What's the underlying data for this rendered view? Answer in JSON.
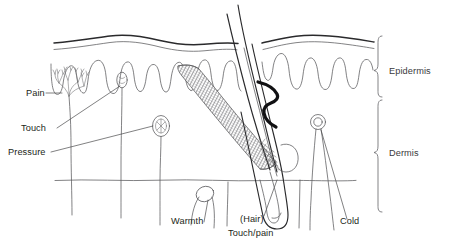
{
  "diagram": {
    "background_color": "#ffffff",
    "line_color": "#3c3c3e",
    "text_color": "#231f20"
  },
  "labels": {
    "pain": "Pain",
    "touch": "Touch",
    "pressure": "Pressure",
    "warmth": "Warmth",
    "hair": "(Hair)",
    "touch_pain": "Touch/pain",
    "cold": "Cold"
  },
  "layers": {
    "epidermis": "Epidermis",
    "dermis": "Dermis"
  }
}
